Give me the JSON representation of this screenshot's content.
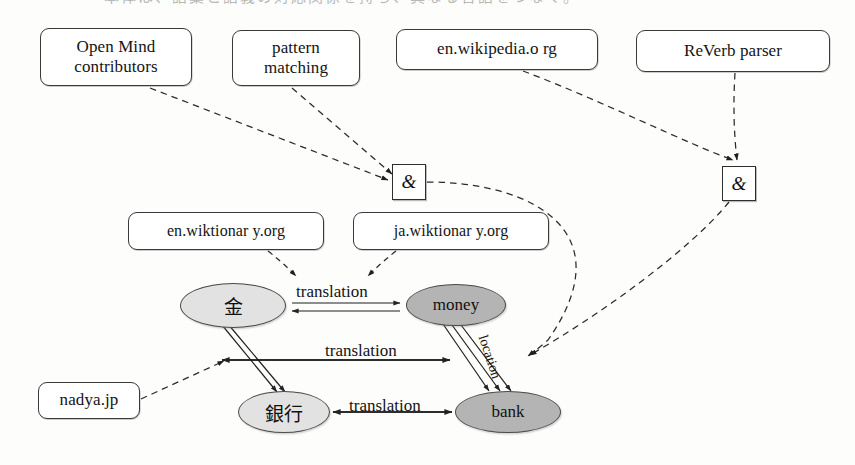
{
  "figure": {
    "top_cropped_text": "本体は、語彙と語義の対応関係を持ち、異なる言語をつなぐ。",
    "background_color": "#fdfdfc",
    "line_color": "#2e2e2e"
  },
  "sources": [
    {
      "id": "open-mind",
      "lines": [
        "Open Mind",
        "contributors"
      ],
      "x": 40,
      "y": 28,
      "w": 152,
      "h": 58,
      "font_size": 17
    },
    {
      "id": "pattern-match",
      "lines": [
        "pattern",
        "matching"
      ],
      "x": 232,
      "y": 30,
      "w": 128,
      "h": 56,
      "font_size": 17
    },
    {
      "id": "en-wikipedia",
      "lines": [
        "en.wikipedia.o rg"
      ],
      "x": 396,
      "y": 29,
      "w": 202,
      "h": 41,
      "font_size": 17
    },
    {
      "id": "reverb-parser",
      "lines": [
        "ReVerb parser"
      ],
      "x": 636,
      "y": 30,
      "w": 194,
      "h": 42,
      "font_size": 17
    },
    {
      "id": "en-wiktionary",
      "lines": [
        "en.wiktionar y.org"
      ],
      "x": 128,
      "y": 212,
      "w": 196,
      "h": 38,
      "font_size": 16
    },
    {
      "id": "ja-wiktionary",
      "lines": [
        "ja.wiktionar y.org"
      ],
      "x": 353,
      "y": 212,
      "w": 196,
      "h": 38,
      "font_size": 16
    },
    {
      "id": "nadya-jp",
      "lines": [
        "nadya.jp"
      ],
      "x": 38,
      "y": 382,
      "w": 102,
      "h": 37,
      "font_size": 17
    }
  ],
  "junctions": [
    {
      "id": "amp-left",
      "label": "&",
      "x": 392,
      "y": 164,
      "w": 34,
      "h": 36
    },
    {
      "id": "amp-right",
      "label": "&",
      "x": 722,
      "y": 166,
      "w": 34,
      "h": 35
    }
  ],
  "nodes": [
    {
      "id": "kane",
      "label": "金",
      "shade": "light",
      "cjk": true,
      "x": 180,
      "y": 283,
      "w": 106,
      "h": 45,
      "font_size": 19
    },
    {
      "id": "money",
      "label": "money",
      "shade": "dark",
      "cjk": false,
      "x": 406,
      "y": 284,
      "w": 100,
      "h": 42,
      "font_size": 17
    },
    {
      "id": "ginkou",
      "label": "銀行",
      "shade": "light",
      "cjk": true,
      "x": 238,
      "y": 391,
      "w": 92,
      "h": 42,
      "font_size": 19
    },
    {
      "id": "bank",
      "label": "bank",
      "shade": "dark",
      "cjk": false,
      "x": 455,
      "y": 391,
      "w": 106,
      "h": 42,
      "font_size": 17
    }
  ],
  "edge_labels": [
    {
      "id": "translation-kane-money",
      "text": "translation",
      "x": 296,
      "y": 282,
      "font_size": 17,
      "rotated": false
    },
    {
      "id": "translation-kane-bank",
      "text": "translation",
      "x": 325,
      "y": 341,
      "font_size": 17,
      "rotated": false
    },
    {
      "id": "translation-ginkou-bank",
      "text": "translation",
      "x": 349,
      "y": 396,
      "font_size": 17,
      "rotated": false
    },
    {
      "id": "location-money-bank",
      "text": "location",
      "x": 490,
      "y": 333,
      "font_size": 14,
      "rotated": true
    }
  ],
  "relations": [
    {
      "from": "kane",
      "to": "money",
      "label": "translation",
      "style": "double-arrow-bidirectional"
    },
    {
      "from": "kane",
      "to": "bank",
      "label": "translation",
      "style": "single-arrow-bidirectional"
    },
    {
      "from": "ginkou",
      "to": "bank",
      "label": "translation",
      "style": "single-arrow-bidirectional"
    },
    {
      "from": "kane",
      "to": "ginkou",
      "label": "",
      "style": "double-line-arrow"
    },
    {
      "from": "money",
      "to": "bank",
      "label": "location",
      "style": "triple-line-arrow"
    }
  ],
  "provenance": [
    {
      "from": "open-mind",
      "to": "amp-left",
      "style": "dashed"
    },
    {
      "from": "pattern-match",
      "to": "amp-left",
      "style": "dashed"
    },
    {
      "from": "en-wikipedia",
      "to": "amp-right",
      "style": "dashed"
    },
    {
      "from": "reverb-parser",
      "to": "amp-right",
      "style": "dashed"
    },
    {
      "from": "amp-left",
      "to": "location-money-bank",
      "style": "dashed-curved"
    },
    {
      "from": "amp-right",
      "to": "location-money-bank",
      "style": "dashed-curved"
    },
    {
      "from": "en-wiktionary",
      "to": "kane",
      "style": "dashed"
    },
    {
      "from": "ja-wiktionary",
      "to": "money",
      "style": "dashed"
    },
    {
      "from": "nadya-jp",
      "to": "kane-bank-edge",
      "style": "dashed"
    }
  ]
}
